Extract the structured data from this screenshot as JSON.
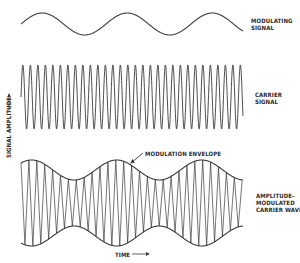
{
  "labels": {
    "modulating": "MODULATING\nSIGNAL",
    "carrier": "CARRIER\nSIGNAL",
    "am": "AMPLITUDE–\nMODULATED\nCARRIER WAVE",
    "envelope": "MODULATION ENVELOPE",
    "y_axis": "SIGNAL AMPLITUDE",
    "x_axis": "TIME"
  },
  "colors": {
    "stroke": "#3a3a3a",
    "background": "#ffffff"
  },
  "waves": {
    "x_start": 21,
    "x_end": 243,
    "modulating": {
      "center_y": 24,
      "amplitude": 11,
      "period": 85,
      "phase_deg": 0
    },
    "carrier": {
      "center_y": 97,
      "amplitude": 32,
      "period": 7.5,
      "phase_deg": 0
    },
    "am": {
      "center_y": 203,
      "base_amplitude": 33,
      "mod_depth": 10,
      "carrier_period": 7.9,
      "mod_period": 85,
      "mod_phase_deg": 45
    }
  },
  "envelope_arrow": {
    "x1": 143,
    "y1": 153,
    "x2": 131,
    "y2": 163
  },
  "axis_arrows": {
    "y": {
      "x": 9,
      "y1": 112,
      "y2": 94
    },
    "x": {
      "y": 254,
      "x1": 132,
      "x2": 149
    }
  }
}
